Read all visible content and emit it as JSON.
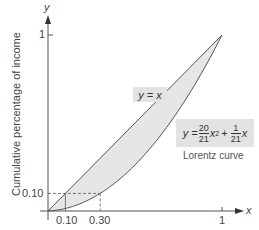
{
  "chart_data": {
    "type": "line",
    "title": "",
    "xlabel": "x",
    "ylabel": "Cumulative percentage of income",
    "y_axis_symbol": "y",
    "xlim": [
      0,
      1
    ],
    "ylim": [
      0,
      1
    ],
    "x_ticks": [
      "0.10",
      "0.30",
      "1"
    ],
    "y_ticks": [
      "0.10",
      "1"
    ],
    "grid": false,
    "series": [
      {
        "name": "y = x",
        "label": "y = x",
        "x": [
          0,
          1
        ],
        "y": [
          0,
          1
        ]
      },
      {
        "name": "Lorentz curve",
        "equation": "y = (20/21) x^2 + (1/21) x",
        "x": [
          0,
          0.1,
          0.2,
          0.3,
          0.4,
          0.5,
          0.6,
          0.7,
          0.8,
          0.9,
          1.0
        ],
        "y": [
          0,
          0.0143,
          0.0476,
          0.1,
          0.1714,
          0.2619,
          0.3714,
          0.5,
          0.6476,
          0.8143,
          1.0
        ]
      }
    ],
    "shaded_region": "between y = x and Lorentz curve",
    "annotations": [
      {
        "type": "dashed-guide",
        "from": [
          0,
          0.1
        ],
        "to": [
          0.3,
          0.1
        ]
      },
      {
        "type": "dashed-guide",
        "from": [
          0.3,
          0
        ],
        "to": [
          0.3,
          0.1
        ]
      },
      {
        "type": "dashed-guide",
        "from": [
          0.1,
          0
        ],
        "to": [
          0.1,
          0.1
        ]
      }
    ]
  },
  "labels": {
    "y_axis_symbol": "y",
    "x_axis_symbol": "x",
    "ylabel": "Cumulative percentage of income",
    "y_tick_1": "1",
    "y_tick_010": "0.10",
    "x_tick_010": "0.10",
    "x_tick_030": "0.30",
    "x_tick_1": "1",
    "line_label": "y = x",
    "eq_y": "y =",
    "eq_num1": "20",
    "eq_den1": "21",
    "eq_x2": "x",
    "eq_sup": "2",
    "eq_plus": "+",
    "eq_num2": "1",
    "eq_den2": "21",
    "eq_x": "x",
    "curve_name": "Lorentz curve"
  },
  "colors": {
    "shade": "#e6e6e6",
    "line": "#555555",
    "axis": "#555555",
    "label_box": "#e3e3e3"
  }
}
